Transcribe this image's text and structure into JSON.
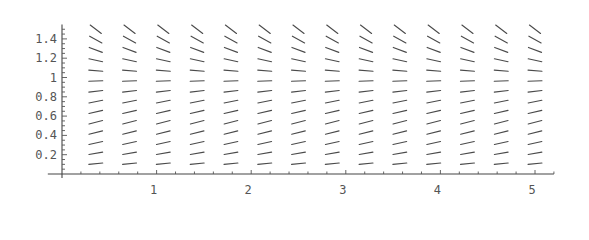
{
  "chart_data": {
    "type": "slope-field",
    "title": "",
    "xlabel": "",
    "ylabel": "",
    "equation": "dy/dx = y(1 - y)",
    "xlim": [
      -0.15,
      5.2
    ],
    "ylim": [
      0,
      1.55
    ],
    "grid": false,
    "legend": "none",
    "x_ticks": [
      {
        "value": 1,
        "label": "1"
      },
      {
        "value": 2,
        "label": "2"
      },
      {
        "value": 3,
        "label": "3"
      },
      {
        "value": 4,
        "label": "4"
      },
      {
        "value": 5,
        "label": "5"
      }
    ],
    "x_minor_step": 0.2,
    "y_ticks": [
      {
        "value": 0.2,
        "label": "0.2"
      },
      {
        "value": 0.4,
        "label": "0.4"
      },
      {
        "value": 0.6,
        "label": "0.6"
      },
      {
        "value": 0.8,
        "label": "0.8"
      },
      {
        "value": 1.0,
        "label": "1"
      },
      {
        "value": 1.2,
        "label": "1.2"
      },
      {
        "value": 1.4,
        "label": "1.4"
      }
    ],
    "y_minor_step": 0.05,
    "field_x": [
      0.357,
      0.714,
      1.071,
      1.429,
      1.786,
      2.143,
      2.5,
      2.857,
      3.214,
      3.571,
      3.929,
      4.286,
      4.643,
      5.0
    ],
    "field_y": [
      0.107,
      0.214,
      0.321,
      0.429,
      0.536,
      0.643,
      0.75,
      0.857,
      0.964,
      1.071,
      1.179,
      1.286,
      1.393,
      1.5
    ],
    "field_slopes_by_y": [
      0.096,
      0.168,
      0.218,
      0.245,
      0.249,
      0.23,
      0.188,
      0.122,
      0.035,
      -0.076,
      -0.211,
      -0.368,
      -0.547,
      -0.75
    ],
    "colors": {
      "segments": "#4a4a4a",
      "axes": "#444444",
      "labels": "#555555",
      "background": "#ffffff"
    }
  }
}
